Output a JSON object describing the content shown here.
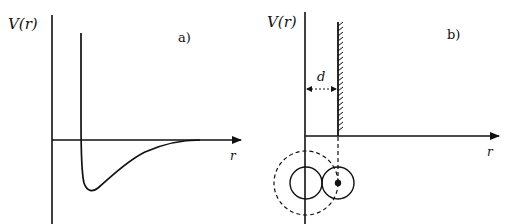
{
  "panel_a": {
    "tag": "a)",
    "y_label": "V(r)",
    "x_label": "r",
    "curve": "potential with repulsive wall and attractive well (Lennard-Jones-like)"
  },
  "panel_b": {
    "tag": "b)",
    "y_label": "V(r)",
    "x_label": "r",
    "distance_label": "d",
    "curve": "hard-wall potential at r = d, zero beyond"
  },
  "colors": {
    "line": "#111111",
    "background": "#ffffff"
  }
}
